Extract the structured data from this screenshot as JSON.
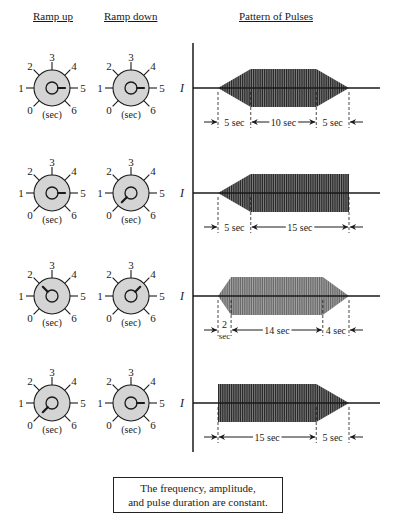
{
  "headers": {
    "ramp_up": "Ramp up",
    "ramp_down": "Ramp down",
    "pattern": "Pattern of Pulses"
  },
  "dial": {
    "tick_labels": [
      "0",
      "1",
      "2",
      "3",
      "4",
      "5",
      "6"
    ],
    "unit_label": "(sec)"
  },
  "axis_label": "I",
  "rows": [
    {
      "ramp_up": 5,
      "ramp_down": 5,
      "segments": [
        {
          "label": "5 sec",
          "seconds": 5,
          "kind": "ramp-up"
        },
        {
          "label": "10 sec",
          "seconds": 10,
          "kind": "plateau"
        },
        {
          "label": "5 sec",
          "seconds": 5,
          "kind": "ramp-down"
        }
      ]
    },
    {
      "ramp_up": 5,
      "ramp_down": 0,
      "segments": [
        {
          "label": "5 sec",
          "seconds": 5,
          "kind": "ramp-up"
        },
        {
          "label": "15 sec",
          "seconds": 15,
          "kind": "plateau"
        }
      ]
    },
    {
      "ramp_up": 2,
      "ramp_down": 4,
      "segments": [
        {
          "label": "2 sec",
          "seconds": 2,
          "kind": "ramp-up"
        },
        {
          "label": "14 sec",
          "seconds": 14,
          "kind": "plateau"
        },
        {
          "label": "4 sec",
          "seconds": 4,
          "kind": "ramp-down"
        }
      ]
    },
    {
      "ramp_up": 0,
      "ramp_down": 5,
      "segments": [
        {
          "label": "15 sec",
          "seconds": 15,
          "kind": "plateau"
        },
        {
          "label": "5 sec",
          "seconds": 5,
          "kind": "ramp-down"
        }
      ]
    }
  ],
  "note": {
    "line1": "The frequency, amplitude,",
    "line2": "and pulse duration are constant."
  },
  "colors": {
    "dial_fill": "#d4d4d4",
    "ink": "#1a1a1a",
    "pulse_dark": "#2a2a2a",
    "pulse_light": "#6a6a6a"
  }
}
